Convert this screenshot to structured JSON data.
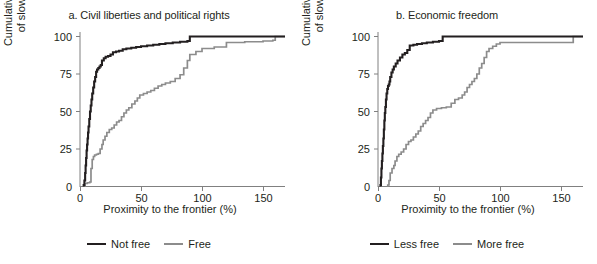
{
  "figure": {
    "background": "#ffffff",
    "text_color": "#231f20"
  },
  "chart_data": [
    {
      "type": "line",
      "panel_id": "a",
      "title": "a. Civil liberties and political rights",
      "xlabel": "Proximity to the frontier (%)",
      "ylabel": "Cumulative probability\nof slowdown (%)",
      "ylabel_line1": "Cumulative probability",
      "ylabel_line2": "of slowdown (%)",
      "xlim": [
        0,
        168
      ],
      "ylim": [
        0,
        103
      ],
      "xticks": [
        0,
        50,
        100,
        150
      ],
      "yticks": [
        0,
        25,
        50,
        75,
        100
      ],
      "xticklabels": [
        "0",
        "50",
        "100",
        "150"
      ],
      "yticklabels": [
        "0",
        "25",
        "50",
        "75",
        "100"
      ],
      "grid": false,
      "legend_position": "bottom-center",
      "series": [
        {
          "name": "Not free",
          "color": "#231f20",
          "width": 2.1,
          "step": "post",
          "x": [
            3.0,
            3.6,
            4.2,
            4.6,
            5.0,
            5.4,
            5.8,
            6.2,
            6.6,
            7.0,
            7.6,
            8.2,
            8.8,
            9.4,
            10.0,
            10.8,
            11.6,
            12.4,
            13.2,
            14.0,
            15.0,
            16.0,
            17.0,
            18.0,
            19.5,
            21.0,
            23.0,
            25.0,
            27.0,
            29.5,
            32.0,
            35.0,
            38.0,
            42.0,
            46.0,
            50.0,
            55.0,
            60.0,
            65.0,
            70.0,
            76.0,
            82.0,
            88.0,
            90.0,
            100.0,
            115.0,
            130.0,
            145.0,
            160.0,
            165.0
          ],
          "y": [
            1.0,
            4.0,
            9.0,
            14.0,
            19.0,
            24.0,
            28.0,
            32.0,
            36.0,
            40.0,
            45.0,
            50.0,
            54.0,
            58.0,
            62.0,
            66.0,
            70.0,
            73.0,
            76.5,
            78.0,
            79.0,
            80.0,
            81.0,
            84.0,
            85.5,
            86.5,
            87.0,
            88.0,
            89.5,
            90.0,
            90.5,
            91.5,
            92.0,
            92.5,
            93.0,
            93.5,
            94.0,
            94.5,
            95.0,
            95.5,
            96.0,
            96.5,
            97.0,
            100.0,
            100.0,
            100.0,
            100.0,
            100.0,
            100.0,
            100.0
          ]
        },
        {
          "name": "Free",
          "color": "#8c8c8c",
          "width": 1.7,
          "step": "post",
          "x": [
            4.0,
            6.0,
            8.0,
            9.0,
            10.0,
            11.0,
            12.0,
            13.5,
            15.0,
            16.5,
            18.0,
            19.0,
            20.5,
            22.0,
            24.0,
            26.0,
            28.0,
            30.0,
            32.0,
            34.0,
            36.0,
            38.0,
            40.0,
            42.5,
            45.0,
            47.0,
            49.0,
            52.0,
            55.0,
            58.0,
            61.0,
            64.0,
            67.0,
            70.0,
            74.0,
            78.0,
            82.0,
            85.0,
            88.0,
            90.0,
            95.0,
            100.0,
            110.0,
            120.0,
            135.0,
            150.0,
            158.0,
            160.0,
            165.0
          ],
          "y": [
            2.0,
            2.5,
            3.0,
            12.0,
            18.0,
            20.0,
            21.0,
            21.5,
            22.0,
            25.0,
            28.0,
            31.0,
            33.5,
            36.0,
            38.0,
            39.0,
            41.0,
            43.0,
            44.0,
            46.5,
            49.0,
            51.0,
            52.5,
            55.0,
            57.0,
            59.0,
            61.0,
            62.0,
            63.0,
            64.0,
            65.5,
            67.0,
            68.0,
            69.0,
            70.0,
            72.0,
            74.5,
            79.0,
            84.0,
            88.0,
            90.0,
            92.0,
            93.0,
            96.0,
            96.5,
            97.0,
            97.5,
            100.0,
            100.0
          ]
        }
      ],
      "legend": [
        {
          "label": "Not free",
          "color": "#231f20"
        },
        {
          "label": "Free",
          "color": "#8c8c8c"
        }
      ]
    },
    {
      "type": "line",
      "panel_id": "b",
      "title": "b. Economic freedom",
      "xlabel": "Proximity to the frontier (%)",
      "ylabel": "Cumulative probability\nof slowdown (%)",
      "ylabel_line1": "Cumulative probability",
      "ylabel_line2": "of slowdown (%)",
      "xlim": [
        0,
        168
      ],
      "ylim": [
        0,
        103
      ],
      "xticks": [
        0,
        50,
        100,
        150
      ],
      "yticks": [
        0,
        25,
        50,
        75,
        100
      ],
      "xticklabels": [
        "0",
        "50",
        "100",
        "150"
      ],
      "yticklabels": [
        "0",
        "25",
        "50",
        "75",
        "100"
      ],
      "grid": false,
      "legend_position": "bottom-center",
      "series": [
        {
          "name": "Less free",
          "color": "#231f20",
          "width": 2.1,
          "step": "post",
          "x": [
            2.0,
            2.4,
            2.8,
            3.2,
            3.6,
            4.0,
            4.4,
            4.8,
            5.2,
            5.6,
            6.0,
            6.5,
            7.0,
            7.6,
            8.2,
            8.8,
            9.4,
            10.0,
            11.0,
            12.0,
            13.0,
            14.5,
            16.0,
            18.0,
            20.0,
            22.0,
            24.0,
            26.0,
            29.0,
            32.0,
            36.0,
            40.0,
            45.0,
            50.0,
            53.0,
            60.0,
            75.0,
            90.0,
            110.0,
            130.0,
            150.0,
            165.0
          ],
          "y": [
            1.0,
            6.0,
            12.0,
            17.0,
            22.0,
            27.0,
            32.0,
            38.0,
            44.0,
            49.0,
            53.0,
            58.0,
            62.0,
            65.0,
            67.0,
            68.0,
            70.0,
            73.0,
            76.0,
            78.0,
            80.0,
            82.0,
            84.0,
            86.0,
            88.0,
            89.0,
            91.0,
            94.0,
            94.5,
            95.0,
            95.5,
            96.0,
            96.5,
            97.0,
            100.0,
            100.0,
            100.0,
            100.0,
            100.0,
            100.0,
            100.0,
            100.0
          ]
        },
        {
          "name": "More free",
          "color": "#8c8c8c",
          "width": 1.7,
          "step": "post",
          "x": [
            8.0,
            9.0,
            10.0,
            11.5,
            13.0,
            14.0,
            15.5,
            17.0,
            19.0,
            21.0,
            23.0,
            25.0,
            27.0,
            29.0,
            31.0,
            33.0,
            35.0,
            37.0,
            39.0,
            41.0,
            43.0,
            45.0,
            48.0,
            52.0,
            56.0,
            60.0,
            63.0,
            66.0,
            69.0,
            71.0,
            73.0,
            75.0,
            77.0,
            79.0,
            81.0,
            83.0,
            85.0,
            87.0,
            89.0,
            91.0,
            94.0,
            97.0,
            100.0,
            115.0,
            130.0,
            145.0,
            158.0,
            160.0,
            165.0
          ],
          "y": [
            1.0,
            4.0,
            9.0,
            12.0,
            14.0,
            17.0,
            20.0,
            21.5,
            23.0,
            25.0,
            28.0,
            30.0,
            31.0,
            33.0,
            35.0,
            37.0,
            40.0,
            42.0,
            44.0,
            46.0,
            49.0,
            51.0,
            52.0,
            52.5,
            53.0,
            55.5,
            58.0,
            59.0,
            61.0,
            63.0,
            66.0,
            68.0,
            70.0,
            72.0,
            75.0,
            79.0,
            82.0,
            86.0,
            90.0,
            92.0,
            93.5,
            95.0,
            96.0,
            96.0,
            96.0,
            96.0,
            96.0,
            100.0,
            100.0
          ]
        }
      ],
      "legend": [
        {
          "label": "Less free",
          "color": "#231f20"
        },
        {
          "label": "More free",
          "color": "#8c8c8c"
        }
      ]
    }
  ]
}
